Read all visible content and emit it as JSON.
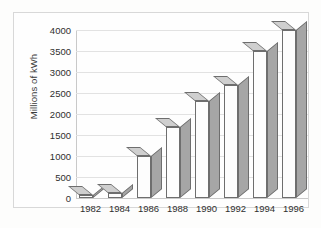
{
  "chart_data": {
    "type": "bar",
    "title": "",
    "subtitle": "",
    "xlabel": "",
    "ylabel": "Millions of kWh",
    "categories": [
      "1982",
      "1984",
      "1986",
      "1988",
      "1990",
      "1992",
      "1994",
      "1996"
    ],
    "values": [
      80,
      120,
      1000,
      1700,
      2300,
      2680,
      3500,
      4000
    ],
    "series": [
      {
        "name": "Millions of kWh",
        "values": [
          80,
          120,
          1000,
          1700,
          2300,
          2680,
          3500,
          4000
        ]
      }
    ],
    "ylim": [
      0,
      4000
    ],
    "ytick_labels": [
      "0",
      "500",
      "1000",
      "1500",
      "2000",
      "2500",
      "3000",
      "3500",
      "4000"
    ],
    "ytick_values": [
      0,
      500,
      1000,
      1500,
      2000,
      2500,
      3000,
      3500,
      4000
    ],
    "grid": true,
    "grid_axis": "y",
    "legend": false,
    "legend_position": "none",
    "style": "3d-columns",
    "colors": {
      "bar_front": "#fdfdfd",
      "bar_side": "#a6a6a6",
      "bar_top": "#cfcfcf",
      "bar_outline": "#6e6e6e",
      "gridline": "#e2e2e2",
      "axis": "#c9c9c9",
      "text": "#2f2f2f",
      "background": "#fefefe",
      "frame_border": "#d8d8d8"
    }
  }
}
